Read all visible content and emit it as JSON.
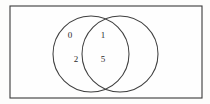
{
  "figure": {
    "type": "venn-diagram",
    "title": "",
    "background_color": "#fdfdfc",
    "stroke_color": "#3a3a3a",
    "text_color": "#2b2b2b"
  },
  "universal_set": {
    "shape": "rectangle",
    "label": "",
    "x": 10,
    "y": 6,
    "width": 192,
    "height": 92
  },
  "circles": [
    {
      "id": "left-circle",
      "label": "",
      "cx": 91,
      "cy": 54,
      "r": 38
    },
    {
      "id": "right-circle",
      "label": "",
      "cx": 120,
      "cy": 54,
      "r": 38
    }
  ],
  "regions": {
    "left_only": {
      "name": "left-only-region",
      "elements": [
        "0",
        "2"
      ]
    },
    "intersection": {
      "name": "intersection-region",
      "elements": [
        "1",
        "5"
      ]
    },
    "right_only": {
      "name": "right-only-region",
      "elements": []
    },
    "outside": {
      "name": "outside-region",
      "elements": []
    }
  },
  "labels": [
    {
      "text": "0",
      "x": 70,
      "y": 36,
      "region": "left_only"
    },
    {
      "text": "2",
      "x": 76,
      "y": 60,
      "region": "left_only"
    },
    {
      "text": "1",
      "x": 103,
      "y": 36,
      "region": "intersection"
    },
    {
      "text": "5",
      "x": 103,
      "y": 60,
      "region": "intersection"
    }
  ]
}
